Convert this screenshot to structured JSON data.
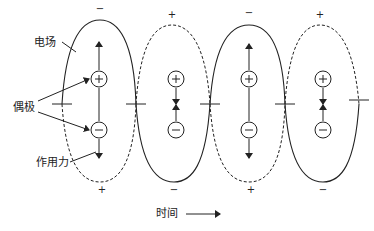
{
  "labels": {
    "field": "电场",
    "dipole": "偶极",
    "force": "作用力",
    "time": "时间"
  },
  "colors": {
    "line": "#222222",
    "background": "#ffffff"
  },
  "top_signs": [
    {
      "x": 100,
      "text": "−"
    },
    {
      "x": 172,
      "text": "+"
    },
    {
      "x": 249,
      "text": "−"
    },
    {
      "x": 320,
      "text": "+"
    }
  ],
  "bottom_signs": [
    {
      "x": 102,
      "text": "+"
    },
    {
      "x": 174,
      "text": "−"
    },
    {
      "x": 251,
      "text": "+"
    },
    {
      "x": 323,
      "text": "−"
    }
  ],
  "dipoles": [
    {
      "x": 99,
      "plus": "+",
      "minus": "−",
      "force": "outward"
    },
    {
      "x": 176,
      "plus": "+",
      "minus": "−",
      "force": "inward"
    },
    {
      "x": 249,
      "plus": "+",
      "minus": "−",
      "force": "outward"
    },
    {
      "x": 323,
      "plus": "+",
      "minus": "−",
      "force": "inward"
    }
  ]
}
